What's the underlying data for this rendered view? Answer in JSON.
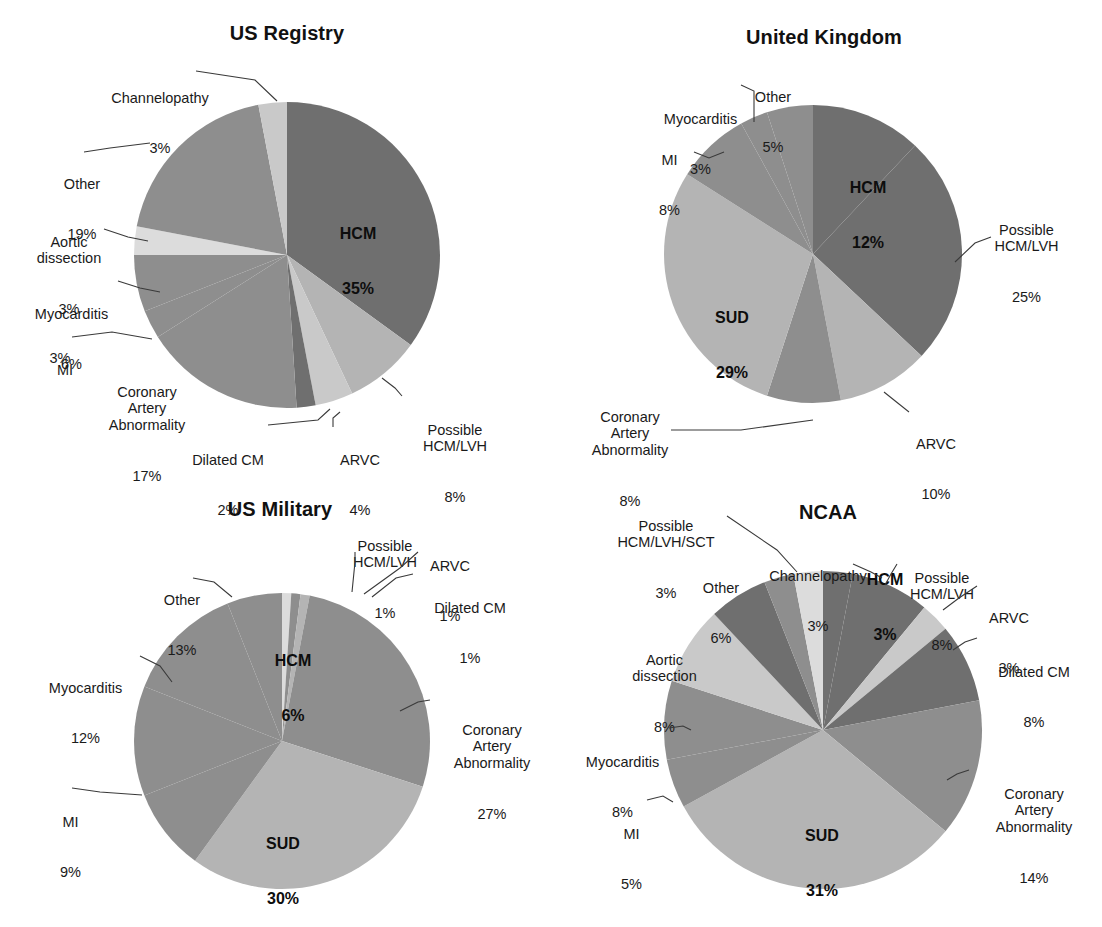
{
  "figure": {
    "palette": {
      "dark": "#6f6f6f",
      "mid": "#8e8e8e",
      "light": "#b4b4b4",
      "lighter": "#c9c9c9",
      "lightest": "#dcdcdc",
      "text": "#1a1a1a",
      "leader": "#3a3a3a",
      "background": "#ffffff"
    }
  },
  "chart_data": [
    {
      "type": "pie",
      "title": "US Registry",
      "unit": "%",
      "start_angle_deg": 0,
      "direction": "clockwise",
      "categories": [
        "HCM",
        "Possible HCM/LVH",
        "ARVC",
        "Dilated CM",
        "Coronary Artery Abnormality",
        "MI",
        "Myocarditis",
        "Aortic dissection",
        "Other",
        "Channelopathy"
      ],
      "values": [
        35,
        8,
        4,
        2,
        17,
        3,
        6,
        3,
        19,
        3
      ],
      "labels": [
        {
          "name": "HCM",
          "value": "35%",
          "placement": "inside"
        },
        {
          "name": "Possible\nHCM/LVH",
          "value": "8%",
          "placement": "outside-right"
        },
        {
          "name": "ARVC",
          "value": "4%",
          "placement": "outside-bottom"
        },
        {
          "name": "Dilated CM",
          "value": "2%",
          "placement": "outside-bottom"
        },
        {
          "name": "Coronary\nArtery\nAbnormality",
          "value": "17%",
          "placement": "outside-left"
        },
        {
          "name": "MI",
          "value": "3%",
          "placement": "outside-left"
        },
        {
          "name": "Myocarditis",
          "value": "6%",
          "placement": "outside-left"
        },
        {
          "name": "Aortic\ndissection",
          "value": "3%",
          "placement": "outside-left"
        },
        {
          "name": "Other",
          "value": "19%",
          "placement": "outside-left"
        },
        {
          "name": "Channelopathy",
          "value": "3%",
          "placement": "outside-top"
        }
      ]
    },
    {
      "type": "pie",
      "title": "United Kingdom",
      "unit": "%",
      "start_angle_deg": 0,
      "direction": "clockwise",
      "categories": [
        "HCM",
        "Possible HCM/LVH",
        "ARVC",
        "Coronary Artery Abnormality",
        "SUD",
        "MI",
        "Myocarditis",
        "Other"
      ],
      "values": [
        12,
        25,
        10,
        8,
        29,
        8,
        3,
        5
      ],
      "labels": [
        {
          "name": "HCM",
          "value": "12%",
          "placement": "inside"
        },
        {
          "name": "Possible\nHCM/LVH",
          "value": "25%",
          "placement": "outside-right"
        },
        {
          "name": "ARVC",
          "value": "10%",
          "placement": "outside-bottom-right"
        },
        {
          "name": "Coronary\nArtery\nAbnormality",
          "value": "8%",
          "placement": "outside-bottom-left"
        },
        {
          "name": "SUD",
          "value": "29%",
          "placement": "inside"
        },
        {
          "name": "MI",
          "value": "8%",
          "placement": "outside-left"
        },
        {
          "name": "Myocarditis",
          "value": "3%",
          "placement": "outside-top-left"
        },
        {
          "name": "Other",
          "value": "5%",
          "placement": "outside-top"
        }
      ]
    },
    {
      "type": "pie",
      "title": "US Military",
      "unit": "%",
      "start_angle_deg": 0,
      "direction": "clockwise",
      "categories": [
        "Possible HCM/LVH",
        "ARVC",
        "Dilated CM",
        "Coronary Artery Abnormality",
        "SUD",
        "MI",
        "Myocarditis",
        "Other",
        "HCM"
      ],
      "values": [
        1,
        1,
        1,
        27,
        30,
        9,
        12,
        13,
        6
      ],
      "labels": [
        {
          "name": "Possible\nHCM/LVH",
          "value": "1%",
          "placement": "outside-top"
        },
        {
          "name": "ARVC",
          "value": "1%",
          "placement": "outside-top-right"
        },
        {
          "name": "Dilated CM",
          "value": "1%",
          "placement": "outside-right"
        },
        {
          "name": "Coronary\nArtery\nAbnormality",
          "value": "27%",
          "placement": "outside-right"
        },
        {
          "name": "SUD",
          "value": "30%",
          "placement": "inside"
        },
        {
          "name": "MI",
          "value": "9%",
          "placement": "outside-left"
        },
        {
          "name": "Myocarditis",
          "value": "12%",
          "placement": "outside-left"
        },
        {
          "name": "Other",
          "value": "13%",
          "placement": "outside-top-left"
        },
        {
          "name": "HCM",
          "value": "6%",
          "placement": "inside"
        }
      ]
    },
    {
      "type": "pie",
      "title": "NCAA",
      "unit": "%",
      "start_angle_deg": 0,
      "direction": "clockwise",
      "categories": [
        "HCM",
        "Possible HCM/LVH",
        "ARVC",
        "Dilated CM",
        "Coronary Artery Abnormality",
        "SUD",
        "MI",
        "Myocarditis",
        "Aortic dissection",
        "Other",
        "Channelopathy",
        "Possible HCM/LVH/SCT"
      ],
      "values": [
        3,
        8,
        3,
        8,
        14,
        31,
        5,
        8,
        8,
        6,
        3,
        3
      ],
      "labels": [
        {
          "name": "HCM",
          "value": "3%",
          "placement": "outside-top"
        },
        {
          "name": "Possible\nHCM/LVH",
          "value": "8%",
          "placement": "outside-top-right"
        },
        {
          "name": "ARVC",
          "value": "3%",
          "placement": "outside-right"
        },
        {
          "name": "Dilated CM",
          "value": "8%",
          "placement": "outside-right"
        },
        {
          "name": "Coronary\nArtery\nAbnormality",
          "value": "14%",
          "placement": "outside-right"
        },
        {
          "name": "SUD",
          "value": "31%",
          "placement": "inside"
        },
        {
          "name": "MI",
          "value": "5%",
          "placement": "outside-left"
        },
        {
          "name": "Myocarditis",
          "value": "8%",
          "placement": "outside-left"
        },
        {
          "name": "Aortic\ndissection",
          "value": "8%",
          "placement": "outside-left"
        },
        {
          "name": "Other",
          "value": "6%",
          "placement": "outside-top-left"
        },
        {
          "name": "Channelopathy",
          "value": "3%",
          "placement": "outside-top"
        },
        {
          "name": "Possible\nHCM/LVH/SCT",
          "value": "3%",
          "placement": "outside-top-left"
        }
      ]
    }
  ],
  "panels": {
    "us_registry": {
      "title": "US Registry",
      "inside": [
        {
          "name": "HCM",
          "pct": "35%"
        }
      ],
      "callouts": {
        "channelopathy": {
          "name": "Channelopathy",
          "pct": "3%"
        },
        "other": {
          "name": "Other",
          "pct": "19%"
        },
        "aortic": {
          "name": "Aortic\ndissection",
          "pct": "3%"
        },
        "myocarditis": {
          "name": "Myocarditis",
          "pct": "6%"
        },
        "mi": {
          "name": "MI",
          "pct": "3%"
        },
        "coronary": {
          "name": "Coronary\nArtery\nAbnormality",
          "pct": "17%"
        },
        "dilated": {
          "name": "Dilated CM",
          "pct": "2%"
        },
        "arvc": {
          "name": "ARVC",
          "pct": "4%"
        },
        "possible": {
          "name": "Possible\nHCM/LVH",
          "pct": "8%"
        }
      }
    },
    "united_kingdom": {
      "title": "United Kingdom",
      "inside": [
        {
          "name": "HCM",
          "pct": "12%"
        },
        {
          "name": "SUD",
          "pct": "29%"
        }
      ],
      "callouts": {
        "other": {
          "name": "Other",
          "pct": "5%"
        },
        "myocarditis": {
          "name": "Myocarditis",
          "pct": "3%"
        },
        "mi": {
          "name": "MI",
          "pct": "8%"
        },
        "coronary": {
          "name": "Coronary\nArtery\nAbnormality",
          "pct": "8%"
        },
        "arvc": {
          "name": "ARVC",
          "pct": "10%"
        },
        "possible": {
          "name": "Possible\nHCM/LVH",
          "pct": "25%"
        }
      }
    },
    "us_military": {
      "title": "US Military",
      "inside": [
        {
          "name": "HCM",
          "pct": "6%"
        },
        {
          "name": "SUD",
          "pct": "30%"
        }
      ],
      "callouts": {
        "possible": {
          "name": "Possible\nHCM/LVH",
          "pct": "1%"
        },
        "arvc": {
          "name": "ARVC",
          "pct": "1%"
        },
        "dilated": {
          "name": "Dilated CM",
          "pct": "1%"
        },
        "other": {
          "name": "Other",
          "pct": "13%"
        },
        "myocarditis": {
          "name": "Myocarditis",
          "pct": "12%"
        },
        "mi": {
          "name": "MI",
          "pct": "9%"
        },
        "coronary": {
          "name": "Coronary\nArtery\nAbnormality",
          "pct": "27%"
        }
      }
    },
    "ncaa": {
      "title": "NCAA",
      "inside": [
        {
          "name": "HCM",
          "pct": "3%"
        },
        {
          "name": "SUD",
          "pct": "31%"
        }
      ],
      "callouts": {
        "possible_sct": {
          "name": "Possible\nHCM/LVH/SCT",
          "pct": "3%"
        },
        "other": {
          "name": "Other",
          "pct": "6%"
        },
        "channelopathy": {
          "name": "Channelopathy",
          "pct": "3%"
        },
        "possible": {
          "name": "Possible\nHCM/LVH",
          "pct": "8%"
        },
        "arvc": {
          "name": "ARVC",
          "pct": "3%"
        },
        "dilated": {
          "name": "Dilated CM",
          "pct": "8%"
        },
        "coronary": {
          "name": "Coronary\nArtery\nAbnormality",
          "pct": "14%"
        },
        "aortic": {
          "name": "Aortic\ndissection",
          "pct": "8%"
        },
        "myocarditis": {
          "name": "Myocarditis",
          "pct": "8%"
        },
        "mi": {
          "name": "MI",
          "pct": "5%"
        }
      }
    }
  }
}
